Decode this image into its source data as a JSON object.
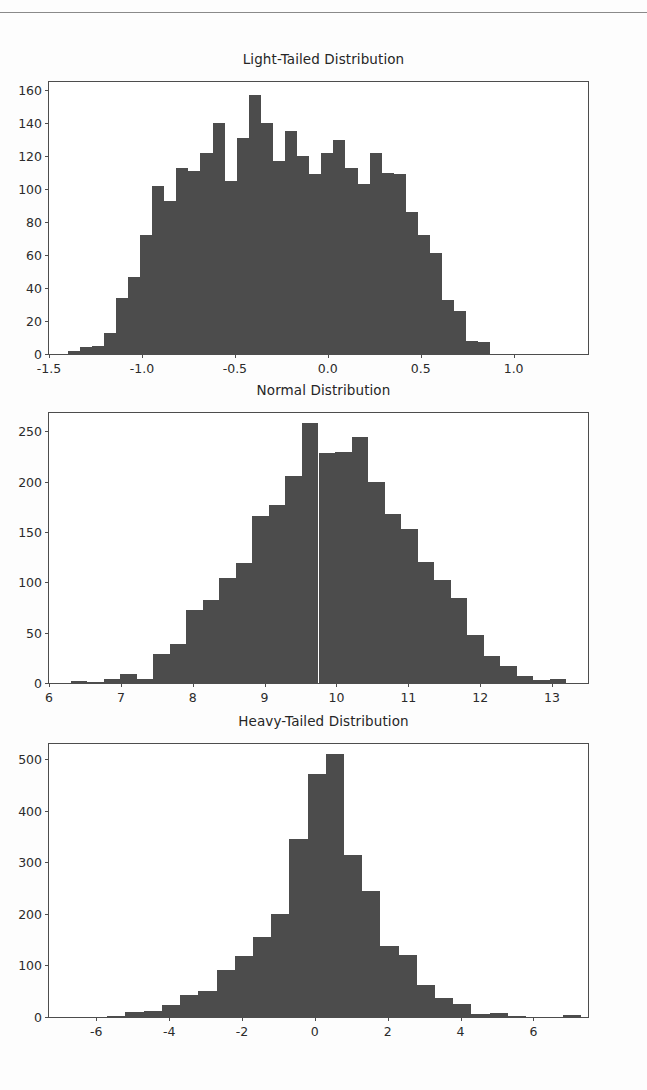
{
  "page": {
    "background_color": "#fdfdfd",
    "rule_color": "#8a8a8a",
    "bar_color": "#4c4c4c",
    "axis_color": "#4d4d4d",
    "text_color": "#2b2b2b"
  },
  "chart_data": [
    {
      "type": "bar",
      "title": "Light-Tailed Distribution",
      "xlabel": "",
      "ylabel": "",
      "grid": false,
      "legend": null,
      "xlim": [
        -1.5,
        1.4
      ],
      "ylim": [
        0,
        165
      ],
      "xticks": [
        -1.5,
        -1.0,
        -0.5,
        0.0,
        0.5,
        1.0
      ],
      "xtick_labels": [
        "-1.5",
        "-1.0",
        "-0.5",
        "0.0",
        "0.5",
        "1.0"
      ],
      "yticks": [
        0,
        20,
        40,
        60,
        80,
        100,
        120,
        140,
        160
      ],
      "ytick_labels": [
        "0",
        "20",
        "40",
        "60",
        "80",
        "100",
        "120",
        "140",
        "160"
      ],
      "bin_edges": [
        -1.4,
        -1.335,
        -1.27,
        -1.205,
        -1.14,
        -1.075,
        -1.01,
        -0.945,
        -0.88,
        -0.815,
        -0.75,
        -0.685,
        -0.62,
        -0.555,
        -0.49,
        -0.425,
        -0.36,
        -0.295,
        -0.23,
        -0.165,
        -0.1,
        -0.035,
        0.03,
        0.095,
        0.16,
        0.225,
        0.29,
        0.355,
        0.42,
        0.485,
        0.55,
        0.615,
        0.68,
        0.745,
        0.81,
        0.875,
        0.94,
        1.005,
        1.07,
        1.135,
        1.2,
        1.265,
        1.33
      ],
      "values": [
        2,
        4,
        5,
        13,
        34,
        47,
        72,
        102,
        93,
        113,
        111,
        122,
        140,
        105,
        131,
        157,
        140,
        117,
        135,
        120,
        109,
        122,
        130,
        113,
        103,
        122,
        110,
        109,
        86,
        72,
        61,
        33,
        26,
        8,
        7
      ]
    },
    {
      "type": "bar",
      "title": "Normal Distribution",
      "xlabel": "",
      "ylabel": "",
      "grid": false,
      "legend": null,
      "xlim": [
        6.0,
        13.5
      ],
      "ylim": [
        0,
        268
      ],
      "xticks": [
        6,
        7,
        8,
        9,
        10,
        11,
        12,
        13
      ],
      "xtick_labels": [
        "6",
        "7",
        "8",
        "9",
        "10",
        "11",
        "12",
        "13"
      ],
      "yticks": [
        0,
        50,
        100,
        150,
        200,
        250
      ],
      "ytick_labels": [
        "0",
        "50",
        "100",
        "150",
        "200",
        "250"
      ],
      "bin_edges": [
        6.3,
        6.53,
        6.76,
        6.99,
        7.22,
        7.45,
        7.68,
        7.91,
        8.14,
        8.37,
        8.6,
        8.83,
        9.06,
        9.29,
        9.52,
        9.75,
        9.98,
        10.21,
        10.44,
        10.67,
        10.9,
        11.13,
        11.36,
        11.59,
        11.82,
        12.05,
        12.28,
        12.51,
        12.74,
        12.97,
        13.2
      ],
      "values": [
        2,
        1,
        4,
        9,
        4,
        29,
        39,
        72,
        82,
        104,
        119,
        166,
        177,
        205,
        258,
        228,
        229,
        244,
        200,
        168,
        153,
        120,
        102,
        84,
        48,
        27,
        17,
        7,
        3,
        4
      ]
    },
    {
      "type": "bar",
      "title": "Heavy-Tailed Distribution",
      "xlabel": "",
      "ylabel": "",
      "grid": false,
      "legend": null,
      "xlim": [
        -7.3,
        7.5
      ],
      "ylim": [
        0,
        530
      ],
      "xticks": [
        -6,
        -4,
        -2,
        0,
        2,
        4,
        6
      ],
      "xtick_labels": [
        "-6",
        "-4",
        "-2",
        "0",
        "2",
        "4",
        "6"
      ],
      "yticks": [
        0,
        100,
        200,
        300,
        400,
        500
      ],
      "ytick_labels": [
        "0",
        "100",
        "200",
        "300",
        "400",
        "500"
      ],
      "bin_edges": [
        -7.2,
        -6.7,
        -6.2,
        -5.7,
        -5.2,
        -4.7,
        -4.2,
        -3.7,
        -3.2,
        -2.7,
        -2.2,
        -1.7,
        -1.2,
        -0.7,
        -0.2,
        0.3,
        0.8,
        1.3,
        1.8,
        2.3,
        2.8,
        3.3,
        3.8,
        4.3,
        4.8,
        5.3,
        5.8,
        6.3,
        6.8,
        7.3
      ],
      "values": [
        1,
        1,
        1,
        2,
        9,
        11,
        24,
        43,
        50,
        92,
        118,
        156,
        200,
        346,
        472,
        510,
        315,
        244,
        138,
        120,
        62,
        36,
        26,
        5,
        7,
        2,
        1,
        1,
        3
      ]
    }
  ]
}
